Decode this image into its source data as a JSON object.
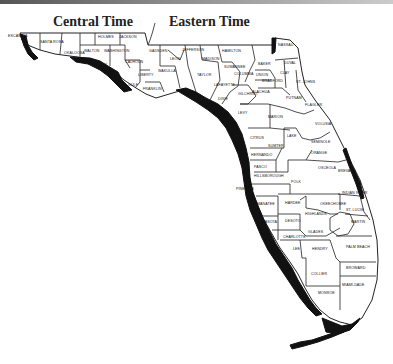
{
  "map": {
    "title_left": "Central Time",
    "title_right": "Eastern Time",
    "state": "Florida",
    "colors": {
      "land": "#ffffff",
      "coast": "#111111",
      "border": "#222222",
      "topbar": "#777777"
    },
    "counties": [
      {
        "name": "ESCAMBIA",
        "x": 22,
        "y": 35
      },
      {
        "name": "SANTA ROSA",
        "x": 45,
        "y": 44
      },
      {
        "name": "OKALOOSA",
        "x": 74,
        "y": 54
      },
      {
        "name": "WALTON",
        "x": 96,
        "y": 51
      },
      {
        "name": "HOLMES",
        "x": 109,
        "y": 36
      },
      {
        "name": "JACKSON",
        "x": 129,
        "y": 36
      },
      {
        "name": "WASHINGTON",
        "x": 115,
        "y": 51
      },
      {
        "name": "BAY",
        "x": 104,
        "y": 64
      },
      {
        "name": "CALHOUN",
        "x": 132,
        "y": 61
      },
      {
        "name": "GULF",
        "x": 131,
        "y": 85
      },
      {
        "name": "LIBERTY",
        "x": 145,
        "y": 75
      },
      {
        "name": "FRANKLIN",
        "x": 152,
        "y": 89
      },
      {
        "name": "GADSDEN",
        "x": 157,
        "y": 50
      },
      {
        "name": "LEON",
        "x": 174,
        "y": 58
      },
      {
        "name": "WAKULLA",
        "x": 165,
        "y": 71
      },
      {
        "name": "JEFFERSON",
        "x": 192,
        "y": 50
      },
      {
        "name": "MADISON",
        "x": 210,
        "y": 58
      },
      {
        "name": "TAYLOR",
        "x": 203,
        "y": 74
      },
      {
        "name": "HAMILTON",
        "x": 233,
        "y": 51
      },
      {
        "name": "SUWANNEE",
        "x": 233,
        "y": 66
      },
      {
        "name": "COLUMBIA",
        "x": 243,
        "y": 73
      },
      {
        "name": "LAFAYETTE",
        "x": 225,
        "y": 84
      },
      {
        "name": "DIXIE",
        "x": 222,
        "y": 99
      },
      {
        "name": "GILCHRIST",
        "x": 248,
        "y": 93
      },
      {
        "name": "BAKER",
        "x": 265,
        "y": 64
      },
      {
        "name": "UNION",
        "x": 261,
        "y": 76
      },
      {
        "name": "BRADFORD",
        "x": 270,
        "y": 81
      },
      {
        "name": "NASSAU",
        "x": 285,
        "y": 45
      },
      {
        "name": "DUVAL",
        "x": 290,
        "y": 62
      },
      {
        "name": "CLAY",
        "x": 285,
        "y": 73
      },
      {
        "name": "ST. JOHNS",
        "x": 302,
        "y": 83
      },
      {
        "name": "ALACHUA",
        "x": 261,
        "y": 92
      },
      {
        "name": "PUTNAM",
        "x": 293,
        "y": 97
      },
      {
        "name": "FLAGLER",
        "x": 311,
        "y": 105
      },
      {
        "name": "LEVY",
        "x": 242,
        "y": 113
      },
      {
        "name": "MARION",
        "x": 276,
        "y": 117
      },
      {
        "name": "VOLUSIA",
        "x": 322,
        "y": 124
      },
      {
        "name": "CITRUS",
        "x": 257,
        "y": 138
      },
      {
        "name": "SUMTER",
        "x": 274,
        "y": 146
      },
      {
        "name": "LAKE",
        "x": 291,
        "y": 136
      },
      {
        "name": "SEMINOLE",
        "x": 320,
        "y": 142
      },
      {
        "name": "ORANGE",
        "x": 318,
        "y": 153
      },
      {
        "name": "HERNANDO",
        "x": 261,
        "y": 155
      },
      {
        "name": "PASCO",
        "x": 258,
        "y": 167
      },
      {
        "name": "BREVARD",
        "x": 345,
        "y": 171
      },
      {
        "name": "OSCEOLA",
        "x": 325,
        "y": 168
      },
      {
        "name": "HILLSBOROUGH",
        "x": 265,
        "y": 176
      },
      {
        "name": "PINELLAS",
        "x": 244,
        "y": 189
      },
      {
        "name": "POLK",
        "x": 295,
        "y": 182
      },
      {
        "name": "INDIAN RIVER",
        "x": 350,
        "y": 194
      },
      {
        "name": "MANATEE",
        "x": 265,
        "y": 204
      },
      {
        "name": "HARDEE",
        "x": 292,
        "y": 203
      },
      {
        "name": "OKEECHOBEE",
        "x": 329,
        "y": 204
      },
      {
        "name": "ST. LUCIE",
        "x": 352,
        "y": 210
      },
      {
        "name": "SARASOTA",
        "x": 265,
        "y": 222
      },
      {
        "name": "DESOTO",
        "x": 291,
        "y": 221
      },
      {
        "name": "HIGHLANDS",
        "x": 314,
        "y": 214
      },
      {
        "name": "MARTIN",
        "x": 357,
        "y": 222
      },
      {
        "name": "CHARLOTTE",
        "x": 291,
        "y": 237
      },
      {
        "name": "GLADES",
        "x": 315,
        "y": 232
      },
      {
        "name": "LEE",
        "x": 296,
        "y": 249
      },
      {
        "name": "HENDRY",
        "x": 318,
        "y": 249
      },
      {
        "name": "PALM BEACH",
        "x": 355,
        "y": 247
      },
      {
        "name": "BROWARD",
        "x": 354,
        "y": 268
      },
      {
        "name": "COLLIER",
        "x": 318,
        "y": 274
      },
      {
        "name": "MONROE",
        "x": 325,
        "y": 293
      },
      {
        "name": "MIAMI-DADE",
        "x": 350,
        "y": 285
      }
    ]
  }
}
